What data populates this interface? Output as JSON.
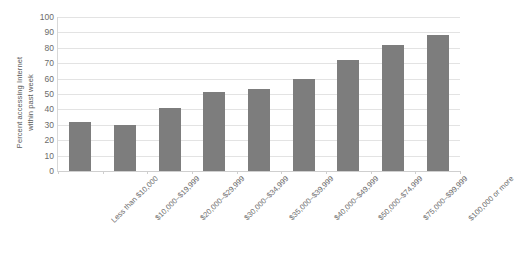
{
  "chart_data": {
    "type": "bar",
    "title": "",
    "xlabel": "",
    "ylabel": "Percent accessing Internet within past week",
    "ylabel_lines": [
      "Percent accessing Internet",
      "within past week"
    ],
    "categories": [
      "Less than $10,000",
      "$10,000–$19,999",
      "$20,000–$29,999",
      "$30,000–$34,999",
      "$35,000–$39,999",
      "$40,000–$49,999",
      "$50,000–$74,999",
      "$75,000–$99,999",
      "$100,000 or more"
    ],
    "values": [
      32,
      30,
      41,
      51,
      53,
      60,
      72,
      82,
      88
    ],
    "ylim": [
      0,
      100
    ],
    "ytick_labels": [
      "0",
      "10",
      "20",
      "30",
      "40",
      "50",
      "60",
      "70",
      "80",
      "90",
      "100"
    ],
    "ytick_values": [
      0,
      10,
      20,
      30,
      40,
      50,
      60,
      70,
      80,
      90,
      100
    ],
    "grid": true,
    "legend": false,
    "bar_color": "#7d7d7d",
    "grid_color": "#e3e3e3",
    "text_color": "#6b6b6b",
    "background": "#ffffff"
  }
}
